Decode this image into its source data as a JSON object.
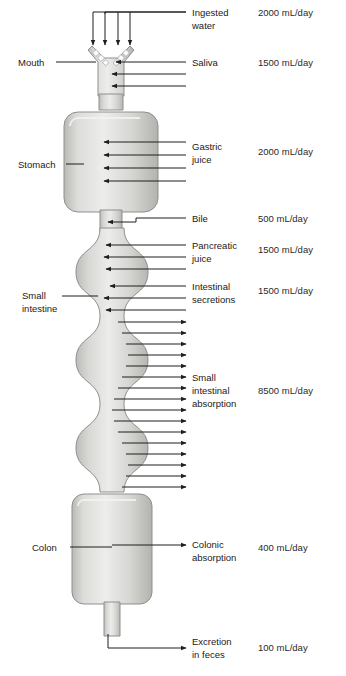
{
  "figure": {
    "type": "anatomical-flow-diagram",
    "colors": {
      "background": "#ffffff",
      "organ_fill_light": "#e8e8e6",
      "organ_fill_mid": "#cfcfcb",
      "organ_fill_dark": "#b4b4b0",
      "organ_stroke": "#8f8f8f",
      "arrow": "#1f1f1f",
      "text": "#1a1a1a"
    }
  },
  "organ_labels": [
    {
      "id": "mouth",
      "text": "Mouth",
      "x": 18,
      "y": 66,
      "leader_x1": 56,
      "leader_x2": 96,
      "leader_y": 62
    },
    {
      "id": "stomach",
      "text": "Stomach",
      "x": 18,
      "y": 168,
      "leader_x1": 66,
      "leader_x2": 84,
      "leader_y": 164
    },
    {
      "id": "small-intestine",
      "text": "Small",
      "text2": "intestine",
      "x": 22,
      "y": 299,
      "leader_x1": 62,
      "leader_x2": 98,
      "leader_y": 296
    },
    {
      "id": "colon",
      "text": "Colon",
      "x": 32,
      "y": 551,
      "leader_x1": 70,
      "leader_x2": 100,
      "leader_y": 547
    }
  ],
  "flows": [
    {
      "id": "ingested-water",
      "label_lines": [
        "Ingested",
        "water"
      ],
      "volume": "2000 mL/day",
      "direction": "in",
      "label_x": 192,
      "label_y": 18,
      "volume_x": 258,
      "volume_y": 18,
      "arrow_count": 4
    },
    {
      "id": "saliva",
      "label_lines": [
        "Saliva"
      ],
      "volume": "1500 mL/day",
      "direction": "in",
      "label_x": 192,
      "label_y": 68,
      "volume_x": 258,
      "volume_y": 68,
      "arrow_count": 3
    },
    {
      "id": "gastric-juice",
      "label_lines": [
        "Gastric",
        "juice"
      ],
      "volume": "2000 mL/day",
      "direction": "in",
      "label_x": 192,
      "label_y": 150,
      "volume_x": 258,
      "volume_y": 157,
      "arrow_count": 4
    },
    {
      "id": "bile",
      "label_lines": [
        "Bile"
      ],
      "volume": "500 mL/day",
      "direction": "in",
      "label_x": 192,
      "label_y": 224,
      "volume_x": 258,
      "volume_y": 224,
      "arrow_count": 1
    },
    {
      "id": "pancreatic-juice",
      "label_lines": [
        "Pancreatic",
        "juice"
      ],
      "volume": "1500 mL/day",
      "direction": "in",
      "label_x": 192,
      "label_y": 250,
      "volume_x": 258,
      "volume_y": 256,
      "arrow_count": 3
    },
    {
      "id": "intestinal-secretions",
      "label_lines": [
        "Intestinal",
        "secretions"
      ],
      "volume": "1500 mL/day",
      "direction": "in",
      "label_x": 192,
      "label_y": 285,
      "volume_x": 258,
      "volume_y": 291,
      "arrow_count": 3
    },
    {
      "id": "small-intestinal-absorption",
      "label_lines": [
        "Small",
        "intestinal",
        "absorption"
      ],
      "volume": "8500 mL/day",
      "direction": "out",
      "label_x": 192,
      "label_y": 382,
      "volume_x": 258,
      "volume_y": 392,
      "arrow_count": 16
    },
    {
      "id": "colonic-absorption",
      "label_lines": [
        "Colonic",
        "absorption"
      ],
      "volume": "400 mL/day",
      "direction": "out",
      "label_x": 192,
      "label_y": 548,
      "volume_x": 258,
      "volume_y": 551,
      "arrow_count": 1
    },
    {
      "id": "excretion-in-feces",
      "label_lines": [
        "Excretion",
        "in feces"
      ],
      "volume": "100 mL/day",
      "direction": "out",
      "label_x": 192,
      "label_y": 645,
      "volume_x": 258,
      "volume_y": 650,
      "arrow_count": 1
    }
  ],
  "chart_data": {
    "type": "table",
    "categories": [
      "Ingested water",
      "Saliva",
      "Gastric juice",
      "Bile",
      "Pancreatic juice",
      "Intestinal secretions",
      "Small intestinal absorption",
      "Colonic absorption",
      "Excretion in feces"
    ],
    "values": [
      2000,
      1500,
      2000,
      500,
      1500,
      1500,
      8500,
      400,
      100
    ],
    "units": "mL/day",
    "direction": [
      "in",
      "in",
      "in",
      "in",
      "in",
      "in",
      "out",
      "out",
      "out"
    ],
    "total_input": 9000,
    "total_absorbed": 8900,
    "xlabel": "",
    "ylabel": "Volume (mL/day)"
  }
}
